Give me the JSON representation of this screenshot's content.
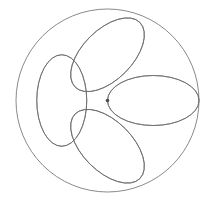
{
  "figure": {
    "canvas": {
      "width": 213,
      "height": 206,
      "background_color": "#ffffff"
    }
  },
  "chart_data": {
    "type": "scatter",
    "subtitle": "",
    "xlabel": "",
    "ylabel": "",
    "xlim": [
      0,
      213
    ],
    "ylim": [
      0,
      206
    ],
    "grid": false,
    "legend": "none",
    "tick_labels": {
      "x": [],
      "y": []
    },
    "annotations": [],
    "geometry": {
      "units": "pixels",
      "center": {
        "x": 107.5,
        "y": 100.5
      },
      "outer_circle": {
        "name": "bounding-circle",
        "cx": 107.5,
        "cy": 100.5,
        "r": 91.5,
        "stroke": "#6b6b6b",
        "stroke_width": 0.8,
        "fill": "none"
      },
      "ellipse_template": {
        "semi_major_axis": 45.75,
        "semi_minor_axis": 25.0,
        "stroke": "#6b6b6b",
        "stroke_width": 0.8,
        "fill": "none",
        "anchor": "one focus-end at circle center, opposite end tangent to bounding circle"
      },
      "ellipse_count": 8,
      "angle_step_degrees": 45,
      "ellipses": [
        {
          "name": "petal-0",
          "angle_deg": 0,
          "cx": 153.25,
          "cy": 100.5,
          "rx": 45.75,
          "ry": 25.0
        },
        {
          "name": "petal-45",
          "angle_deg": 45,
          "cx": 139.85,
          "cy": 68.15,
          "rx": 45.75,
          "ry": 25.0
        },
        {
          "name": "petal-90",
          "angle_deg": 90,
          "cx": 107.5,
          "cy": 54.75,
          "rx": 45.75,
          "ry": 25.0
        },
        {
          "name": "petal-135",
          "angle_deg": 135,
          "cx": 75.15,
          "cy": 68.15,
          "rx": 45.75,
          "ry": 25.0
        },
        {
          "name": "petal-180",
          "angle_deg": 180,
          "cx": 61.75,
          "cy": 100.5,
          "rx": 45.75,
          "ry": 25.0
        },
        {
          "name": "petal-225",
          "angle_deg": 225,
          "cx": 75.15,
          "cy": 132.85,
          "rx": 45.75,
          "ry": 25.0
        },
        {
          "name": "petal-270",
          "angle_deg": 270,
          "cx": 107.5,
          "cy": 146.25,
          "rx": 45.75,
          "ry": 25.0
        },
        {
          "name": "petal-315",
          "angle_deg": 315,
          "cx": 139.85,
          "cy": 132.85,
          "rx": 45.75,
          "ry": 25.0
        }
      ],
      "tangent_points": [
        {
          "name": "tangent-right",
          "x": 199.0,
          "y": 100.5
        },
        {
          "name": "tangent-upper-right",
          "x": 172.2,
          "y": 35.8
        },
        {
          "name": "tangent-top",
          "x": 107.5,
          "y": 9.0
        },
        {
          "name": "tangent-upper-left",
          "x": 42.8,
          "y": 35.8
        },
        {
          "name": "tangent-left",
          "x": 16.0,
          "y": 100.5
        },
        {
          "name": "tangent-lower-left",
          "x": 42.8,
          "y": 165.2
        },
        {
          "name": "tangent-bottom",
          "x": 107.5,
          "y": 192.0
        },
        {
          "name": "tangent-lower-right",
          "x": 172.2,
          "y": 165.2
        }
      ],
      "center_node": {
        "name": "center-convergence-node",
        "x": 107.5,
        "y": 100.5,
        "r": 1.8,
        "fill": "#4a4a4a"
      }
    },
    "colors": {
      "background": "#ffffff",
      "stroke": "#6b6b6b",
      "node": "#4a4a4a"
    }
  }
}
